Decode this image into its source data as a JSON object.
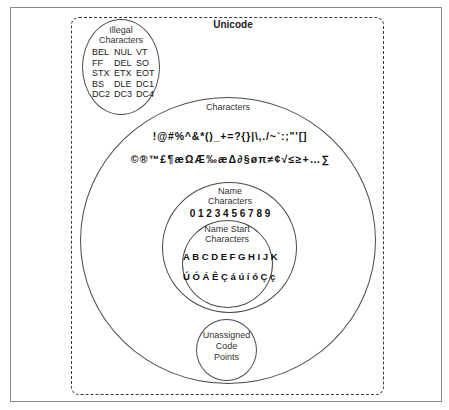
{
  "diagram": {
    "outer_title": "Unicode",
    "illegal": {
      "title_line1": "Illegal",
      "title_line2": "Characters",
      "codes": [
        "BEL",
        "NUL",
        "VT",
        "FF",
        "DEL",
        "SO",
        "STX",
        "ETX",
        "EOT",
        "BS",
        "DLE",
        "DC1",
        "DC2",
        "DC3",
        "DC4"
      ]
    },
    "characters": {
      "title": "Characters",
      "row1": "!@#%^&*()_+=?{}|\\,./~`:;\"'[]",
      "row2": "©®™£¶æΩÆ‰æΔ∂§øπ≠¢√≤≥+…∑"
    },
    "name_characters": {
      "title_line1": "Name",
      "title_line2": "Characters",
      "digits": "0 1 2 3 4 5 6 7 8 9"
    },
    "name_start_characters": {
      "title_line1": "Name Start",
      "title_line2": "Characters",
      "row1": "A B C D E F G H I J K",
      "row2": "Ú Ó Á Ê Ç á ú í ó Ç ç"
    },
    "unassigned": {
      "title_line1": "Unassigned",
      "title_line2": "Code",
      "title_line3": "Points"
    }
  }
}
